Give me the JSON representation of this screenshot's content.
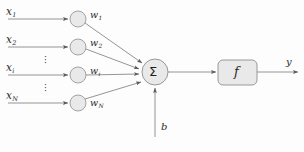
{
  "figure": {
    "background_color": "#fdfdfd",
    "line_color": "#6b6b6b",
    "node_fill": "#e8e8e8",
    "node_stroke": "#8a8a8a",
    "text_color": "#2a2a2a"
  },
  "inputs": [
    {
      "label": "x",
      "subscript": "1",
      "weight_label": "w",
      "weight_subscript": "1"
    },
    {
      "label": "x",
      "subscript": "2",
      "weight_label": "w",
      "weight_subscript": "2"
    },
    {
      "label": "x",
      "subscript": "i",
      "weight_label": "w",
      "weight_subscript": "i"
    },
    {
      "label": "x",
      "subscript": "N",
      "weight_label": "w",
      "weight_subscript": "N"
    }
  ],
  "ellipsis": {
    "glyph": "·",
    "count": 3
  },
  "summation": {
    "label": "Σ",
    "name": "summation-node"
  },
  "bias": {
    "label": "b"
  },
  "activation": {
    "label": "f"
  },
  "output": {
    "label": "y"
  }
}
